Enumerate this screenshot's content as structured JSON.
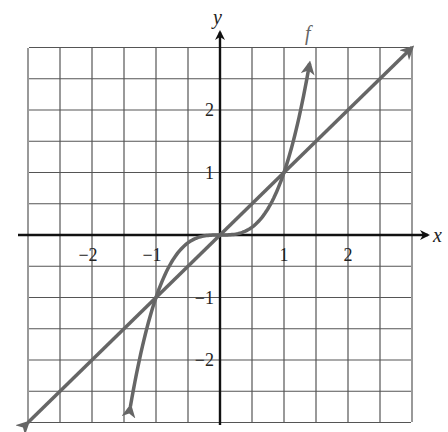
{
  "chart_data": {
    "type": "line",
    "title": "",
    "xlabel": "x",
    "ylabel": "y",
    "xlim": [
      -3,
      3
    ],
    "ylim": [
      -3,
      3
    ],
    "grid": true,
    "grid_step": 0.5,
    "x_ticks": [
      -2,
      -1,
      1,
      2
    ],
    "y_ticks": [
      -2,
      -1,
      1,
      2
    ],
    "x_tick_labels": [
      "−2",
      "−1",
      "1",
      "2"
    ],
    "y_tick_labels": [
      "−2",
      "−1",
      "1",
      "2"
    ],
    "series": [
      {
        "name": "f",
        "label": "f",
        "description": "cubic curve f(x) = x^3 with arrowheads at both ends",
        "x": [
          -1.4,
          -1.2,
          -1,
          -0.75,
          -0.5,
          -0.25,
          0,
          0.25,
          0.5,
          0.75,
          1,
          1.2,
          1.4
        ],
        "y": [
          -2.74,
          -1.73,
          -1,
          -0.42,
          -0.125,
          -0.016,
          0,
          0.016,
          0.125,
          0.42,
          1,
          1.73,
          2.74
        ],
        "color": "#666666"
      },
      {
        "name": "y = x",
        "label": "",
        "description": "identity line with arrowheads at both ends",
        "x": [
          -3,
          3
        ],
        "y": [
          -3,
          3
        ],
        "color": "#666666"
      }
    ],
    "intersections": [
      [
        -1,
        -1
      ],
      [
        0,
        0
      ],
      [
        1,
        1
      ]
    ],
    "legend_position": "none",
    "annotations": [
      {
        "text": "f",
        "near_x": 1.4,
        "near_y": 3.3
      }
    ]
  },
  "labels": {
    "x_axis": "x",
    "y_axis": "y",
    "curve_f": "f",
    "x_ticks": [
      "−2",
      "−1",
      "1",
      "2"
    ],
    "y_ticks": [
      "2",
      "1",
      "−1",
      "−2"
    ]
  },
  "colors": {
    "grid": "#555555",
    "axis": "#111111",
    "curve": "#666666"
  }
}
